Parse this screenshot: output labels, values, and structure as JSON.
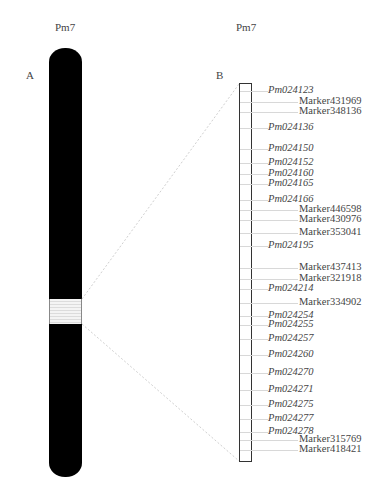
{
  "panel_a": {
    "title": "Pm7",
    "label": "A"
  },
  "panel_b": {
    "title": "Pm7",
    "label": "B"
  },
  "markers": [
    {
      "name": "Pm024123",
      "type": "gene",
      "y": 91
    },
    {
      "name": "Marker431969",
      "type": "marker",
      "y": 102
    },
    {
      "name": "Marker348136",
      "type": "marker",
      "y": 112
    },
    {
      "name": "Pm024136",
      "type": "gene",
      "y": 128
    },
    {
      "name": "Pm024150",
      "type": "gene",
      "y": 149
    },
    {
      "name": "Pm024152",
      "type": "gene",
      "y": 163
    },
    {
      "name": "Pm024160",
      "type": "gene",
      "y": 174
    },
    {
      "name": "Pm024165",
      "type": "gene",
      "y": 184
    },
    {
      "name": "Pm024166",
      "type": "gene",
      "y": 200
    },
    {
      "name": "Marker446598",
      "type": "marker",
      "y": 210
    },
    {
      "name": "Marker430976",
      "type": "marker",
      "y": 220
    },
    {
      "name": "Marker353041",
      "type": "marker",
      "y": 233
    },
    {
      "name": "Pm024195",
      "type": "gene",
      "y": 246
    },
    {
      "name": "Marker437413",
      "type": "marker",
      "y": 268
    },
    {
      "name": "Marker321918",
      "type": "marker",
      "y": 279
    },
    {
      "name": "Pm024214",
      "type": "gene",
      "y": 289
    },
    {
      "name": "Marker334902",
      "type": "marker",
      "y": 303
    },
    {
      "name": "Pm024254",
      "type": "gene",
      "y": 316
    },
    {
      "name": "Pm024255",
      "type": "gene",
      "y": 325
    },
    {
      "name": "Pm024257",
      "type": "gene",
      "y": 339
    },
    {
      "name": "Pm024260",
      "type": "gene",
      "y": 355
    },
    {
      "name": "Pm024270",
      "type": "gene",
      "y": 373
    },
    {
      "name": "Pm024271",
      "type": "gene",
      "y": 390
    },
    {
      "name": "Pm024275",
      "type": "gene",
      "y": 405
    },
    {
      "name": "Pm024277",
      "type": "gene",
      "y": 419
    },
    {
      "name": "Pm024278",
      "type": "gene",
      "y": 432
    },
    {
      "name": "Marker315769",
      "type": "marker",
      "y": 440
    },
    {
      "name": "Marker418421",
      "type": "marker",
      "y": 450
    }
  ]
}
